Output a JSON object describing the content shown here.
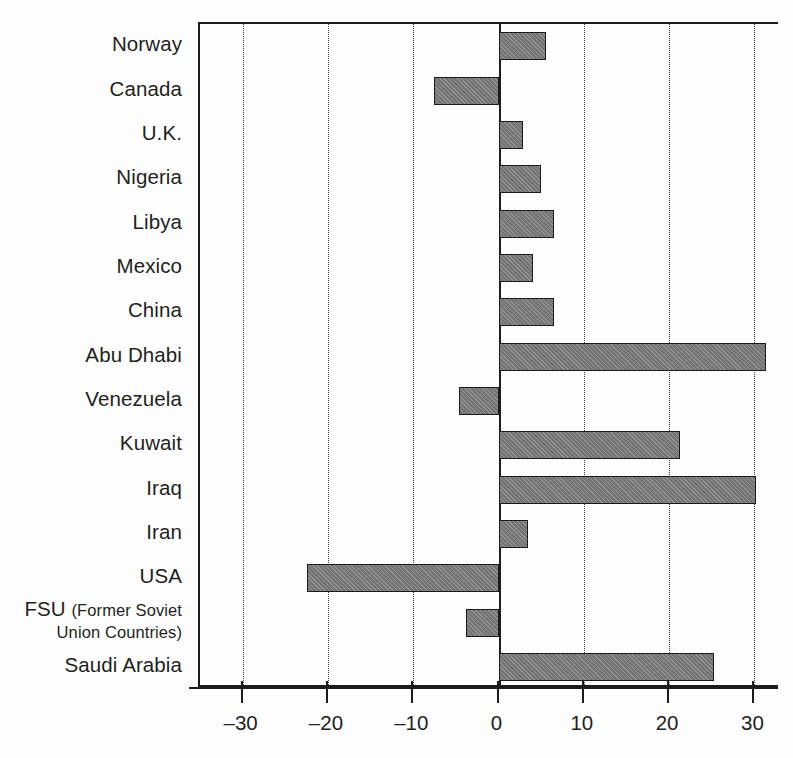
{
  "chart_data": {
    "type": "bar",
    "orientation": "horizontal",
    "title": "",
    "subtitle": "",
    "xlabel": "",
    "ylabel": "",
    "xlim": [
      -35,
      33
    ],
    "grid": true,
    "gridlines_x": [
      -30,
      -20,
      -10,
      0,
      10,
      20,
      30
    ],
    "legend": null,
    "categories": [
      "Norway",
      "Canada",
      "U.K.",
      "Nigeria",
      "Libya",
      "Mexico",
      "China",
      "Abu Dhabi",
      "Venezuela",
      "Kuwait",
      "Iraq",
      "Iran",
      "USA",
      "FSU (Former Soviet Union Countries)",
      "Saudi Arabia"
    ],
    "values": [
      5.6,
      -7.6,
      2.9,
      5.0,
      6.5,
      4.0,
      6.5,
      31.4,
      -4.6,
      21.3,
      30.2,
      3.5,
      -22.4,
      -3.8,
      25.3
    ],
    "ticks": [
      {
        "value": -30,
        "label": "–30"
      },
      {
        "value": -20,
        "label": "–20"
      },
      {
        "value": -10,
        "label": "–10"
      },
      {
        "value": 0,
        "label": "0"
      },
      {
        "value": 10,
        "label": "10"
      },
      {
        "value": 20,
        "label": "20"
      },
      {
        "value": 30,
        "label": "30"
      }
    ],
    "colors": {
      "bar_fill": "#7b7b7b",
      "bar_border": "#1a1a1a",
      "axis": "#1c1c1c",
      "grid": "#3a3a3a",
      "text": "#231f20",
      "background": "#fdfdfd"
    }
  },
  "category_labels": [
    {
      "text": "Norway",
      "two_line": false,
      "main": "Norway",
      "sub": ""
    },
    {
      "text": "Canada",
      "two_line": false,
      "main": "Canada",
      "sub": ""
    },
    {
      "text": "U.K.",
      "two_line": false,
      "main": "U.K.",
      "sub": ""
    },
    {
      "text": "Nigeria",
      "two_line": false,
      "main": "Nigeria",
      "sub": ""
    },
    {
      "text": "Libya",
      "two_line": false,
      "main": "Libya",
      "sub": ""
    },
    {
      "text": "Mexico",
      "two_line": false,
      "main": "Mexico",
      "sub": ""
    },
    {
      "text": "China",
      "two_line": false,
      "main": "China",
      "sub": ""
    },
    {
      "text": "Abu Dhabi",
      "two_line": false,
      "main": "Abu Dhabi",
      "sub": ""
    },
    {
      "text": "Venezuela",
      "two_line": false,
      "main": "Venezuela",
      "sub": ""
    },
    {
      "text": "Kuwait",
      "two_line": false,
      "main": "Kuwait",
      "sub": ""
    },
    {
      "text": "Iraq",
      "two_line": false,
      "main": "Iraq",
      "sub": ""
    },
    {
      "text": "Iran",
      "two_line": false,
      "main": "Iran",
      "sub": ""
    },
    {
      "text": "USA",
      "two_line": false,
      "main": "USA",
      "sub": ""
    },
    {
      "text": "FSU (Former Soviet Union Countries)",
      "two_line": true,
      "main": "FSU ",
      "sub": "(Former Soviet Union Countries)"
    },
    {
      "text": "Saudi Arabia",
      "two_line": false,
      "main": "Saudi Arabia",
      "sub": ""
    }
  ]
}
